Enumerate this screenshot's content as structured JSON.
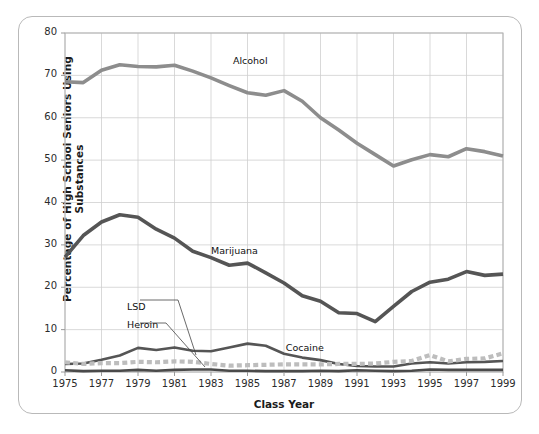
{
  "chart_data": {
    "type": "line",
    "title": "",
    "xlabel": "Class Year",
    "ylabel": "Percentage of High School Seniors Using Substances",
    "xlim": [
      1975,
      1999
    ],
    "ylim": [
      0,
      80
    ],
    "yticks": [
      0,
      10,
      20,
      30,
      40,
      50,
      60,
      70,
      80
    ],
    "xticks": [
      1975,
      1977,
      1979,
      1981,
      1983,
      1985,
      1987,
      1989,
      1991,
      1993,
      1995,
      1997,
      1999
    ],
    "grid": true,
    "legend_position": "inline-labels",
    "x": [
      1975,
      1976,
      1977,
      1978,
      1979,
      1980,
      1981,
      1982,
      1983,
      1984,
      1985,
      1986,
      1987,
      1988,
      1989,
      1990,
      1991,
      1992,
      1993,
      1994,
      1995,
      1996,
      1997,
      1998,
      1999
    ],
    "series": [
      {
        "name": "Alcohol",
        "color": "#8d8d8d",
        "style": "solid",
        "label_x": 1984.2,
        "label_y": 73.5,
        "values": [
          68.5,
          68.3,
          71.2,
          72.5,
          72.1,
          72.0,
          72.4,
          71.0,
          69.4,
          67.6,
          65.9,
          65.3,
          66.4,
          63.9,
          60.0,
          57.1,
          54.0,
          51.3,
          48.6,
          50.1,
          51.3,
          50.8,
          52.7,
          52.0,
          51.0
        ]
      },
      {
        "name": "Marijuana",
        "color": "#555555",
        "style": "solid",
        "label_x": 1983.0,
        "label_y": 28.5,
        "values": [
          27.1,
          32.2,
          35.4,
          37.1,
          36.5,
          33.7,
          31.6,
          28.5,
          27.0,
          25.2,
          25.7,
          23.4,
          21.0,
          18.0,
          16.7,
          14.0,
          13.8,
          11.9,
          15.5,
          19.0,
          21.2,
          21.9,
          23.7,
          22.8,
          23.1
        ]
      },
      {
        "name": "Cocaine",
        "color": "#555555",
        "style": "solid",
        "label_x": 1987.1,
        "label_y": 5.6,
        "values": [
          1.9,
          2.0,
          2.9,
          3.9,
          5.7,
          5.2,
          5.8,
          5.0,
          4.9,
          5.8,
          6.7,
          6.2,
          4.3,
          3.4,
          2.8,
          1.9,
          1.4,
          1.3,
          1.3,
          2.0,
          2.3,
          2.0,
          2.3,
          2.4,
          2.6
        ]
      },
      {
        "name": "LSD",
        "color": "#bdbdbd",
        "style": "dashed",
        "label_x": 1978.4,
        "label_y": 15.3,
        "values": [
          2.3,
          1.9,
          2.1,
          2.1,
          2.4,
          2.3,
          2.5,
          2.4,
          1.9,
          1.5,
          1.6,
          1.7,
          1.8,
          1.8,
          1.8,
          1.9,
          1.9,
          2.0,
          2.4,
          2.6,
          4.0,
          2.5,
          3.1,
          3.2,
          4.4
        ]
      },
      {
        "name": "Heroin",
        "color": "#4a4a4a",
        "style": "solid",
        "label_x": 1978.4,
        "label_y": 11.2,
        "values": [
          0.4,
          0.2,
          0.3,
          0.3,
          0.5,
          0.3,
          0.5,
          0.6,
          0.6,
          0.3,
          0.3,
          0.2,
          0.2,
          0.2,
          0.3,
          0.2,
          0.4,
          0.3,
          0.2,
          0.3,
          0.6,
          0.5,
          0.5,
          0.5,
          0.5
        ]
      }
    ]
  },
  "axis": {
    "yticks_text": [
      "0",
      "10",
      "20",
      "30",
      "40",
      "50",
      "60",
      "70",
      "80"
    ],
    "xticks_text": [
      "1975",
      "1977",
      "1979",
      "1981",
      "1983",
      "1985",
      "1987",
      "1989",
      "1991",
      "1993",
      "1995",
      "1997",
      "1999"
    ],
    "xlabel": "Class Year",
    "ylabel": "Percentage of High School Seniors Using Substances"
  },
  "series_labels": {
    "alcohol": "Alcohol",
    "marijuana": "Marijuana",
    "cocaine": "Cocaine",
    "lsd": "LSD",
    "heroin": "Heroin"
  }
}
